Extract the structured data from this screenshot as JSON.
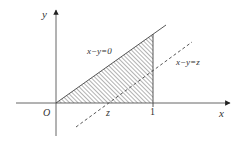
{
  "diagram": {
    "axes": {
      "x_label": "x",
      "y_label": "y",
      "origin_label": "O"
    },
    "ticks": {
      "z_label": "z",
      "one_label": "1"
    },
    "lines": {
      "solid_label": "x−y=0",
      "dashed_label": "x−y=z"
    },
    "colors": {
      "ink": "#444444",
      "hatch": "#555555",
      "background": "#ffffff"
    }
  }
}
